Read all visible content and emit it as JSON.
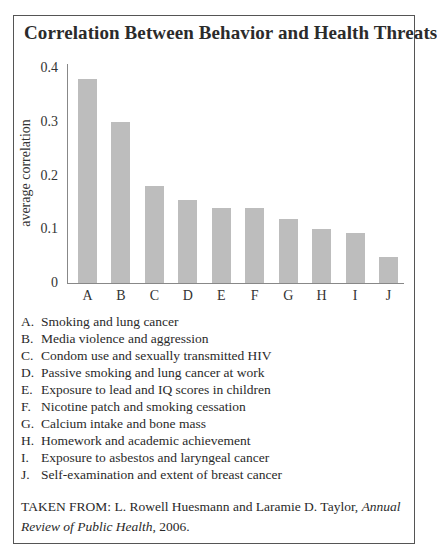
{
  "title": "Correlation Between Behavior and Health Threats",
  "colors": {
    "bar": "#bdbdbd",
    "axis": "#888888",
    "frame": "#555555"
  },
  "chart_data": {
    "type": "bar",
    "title": "Correlation Between Behavior and Health Threats",
    "xlabel": "",
    "ylabel": "average correlation",
    "ylim": [
      0,
      0.4
    ],
    "yticks": [
      "0",
      "0.1",
      "0.2",
      "0.3",
      "0.4"
    ],
    "grid": false,
    "categories": [
      "A",
      "B",
      "C",
      "D",
      "E",
      "F",
      "G",
      "H",
      "I",
      "J"
    ],
    "values": [
      0.38,
      0.3,
      0.18,
      0.155,
      0.14,
      0.14,
      0.12,
      0.1,
      0.093,
      0.048
    ],
    "legend": [
      {
        "key": "A.",
        "label": "Smoking and lung cancer"
      },
      {
        "key": "B.",
        "label": "Media violence and aggression"
      },
      {
        "key": "C.",
        "label": "Condom use and sexually transmitted HIV"
      },
      {
        "key": "D.",
        "label": "Passive smoking and lung cancer at work"
      },
      {
        "key": "E.",
        "label": "Exposure to lead and IQ scores in children"
      },
      {
        "key": "F.",
        "label": "Nicotine patch and smoking cessation"
      },
      {
        "key": "G.",
        "label": "Calcium intake and bone mass"
      },
      {
        "key": "H.",
        "label": "Homework and academic achievement"
      },
      {
        "key": "I.",
        "label": "Exposure to asbestos and laryngeal cancer"
      },
      {
        "key": "J.",
        "label": "Self-examination and extent of breast cancer"
      }
    ]
  },
  "source": {
    "prefix": "TAKEN FROM: L. Rowell Huesmann and Laramie D. Taylor, ",
    "journal": "Annual Review of Public Health",
    "suffix": ", 2006."
  }
}
